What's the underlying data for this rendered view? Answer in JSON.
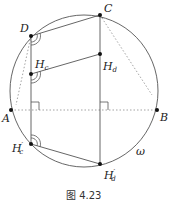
{
  "figure": {
    "caption": "图 4.23",
    "circle_label": "ω",
    "points": {
      "A": "A",
      "B": "B",
      "C": "C",
      "D": "D",
      "Hc": "H",
      "Hc_sub": "c",
      "Hd": "H",
      "Hd_sub": "d",
      "Hc_prime": "H",
      "Hc_prime_sub": "c",
      "Hd_prime": "H",
      "Hd_prime_sub": "d",
      "prime": "′"
    },
    "colors": {
      "stroke": "#555555",
      "dotted": "#999999",
      "point": "#111111"
    }
  }
}
